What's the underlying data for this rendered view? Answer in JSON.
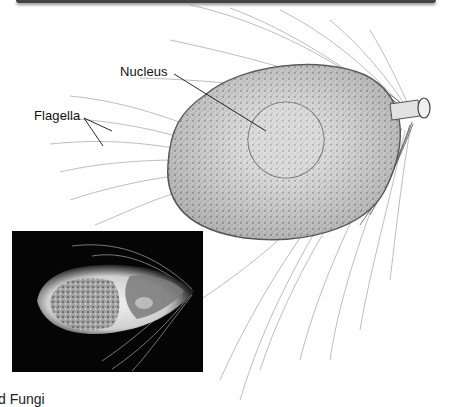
{
  "figure": {
    "labels": {
      "nucleus": "Nucleus",
      "flagella": "Flagella"
    },
    "inset_photo": {
      "description": "micrograph-of-organism",
      "background": "#050505"
    },
    "colors": {
      "line": "#111111",
      "flagella_stroke": "#9a9a9a",
      "cell_fill": "#d8d8d8"
    }
  },
  "page": {
    "caption_fragment": "d Fungi"
  }
}
